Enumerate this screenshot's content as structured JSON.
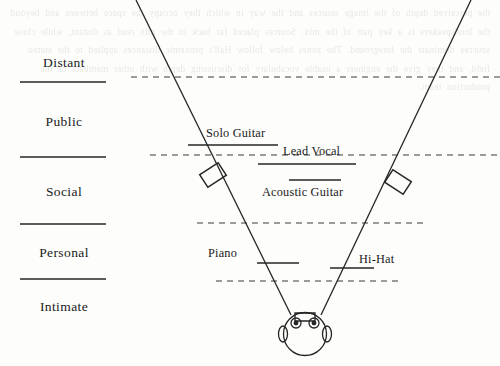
{
  "diagram": {
    "background_bleed_text": "the perceived depth of the image sources and the way in which they occupy the space between and beyond the loudspeakers is a key part of the mix. Sources placed far back in the mix read as distant, while close sources dominate the foreground. The zones below follow Hall's proxemic distances applied to the stereo field, and they give the engineer a usable vocabulary for discussing depth with other members of the production team.",
    "line_color": "#262626",
    "dash_color": "#3a3a3a",
    "zones": [
      {
        "id": "distant",
        "label": "Distant",
        "label_y": 55,
        "rule_y": 82,
        "rule_x1": 20,
        "rule_x2": 106
      },
      {
        "id": "public",
        "label": "Public",
        "label_y": 114,
        "rule_y": 157,
        "rule_x1": 20,
        "rule_x2": 106
      },
      {
        "id": "social",
        "label": "Social",
        "label_y": 184,
        "rule_y": 224,
        "rule_x1": 20,
        "rule_x2": 106
      },
      {
        "id": "personal",
        "label": "Personal",
        "label_y": 245,
        "rule_y": 279,
        "rule_x1": 20,
        "rule_x2": 106
      },
      {
        "id": "intimate",
        "label": "Intimate",
        "label_y": 299,
        "rule_y": null,
        "rule_x1": null,
        "rule_x2": null
      }
    ],
    "depth_dividers": [
      {
        "id": "divider-distant-public",
        "y": 77,
        "x1": 131,
        "x2": 500
      },
      {
        "id": "divider-public-social",
        "y": 155,
        "x1": 150,
        "x2": 500
      },
      {
        "id": "divider-social-personal",
        "y": 223,
        "x1": 197,
        "x2": 424
      },
      {
        "id": "divider-personal-intimate",
        "y": 281,
        "x1": 216,
        "x2": 399
      }
    ],
    "stage_edges": [
      {
        "id": "left-stage-edge",
        "x1": 136,
        "y1": 0,
        "x2": 290,
        "y2": 314
      },
      {
        "id": "right-stage-edge",
        "x1": 471,
        "y1": 0,
        "x2": 322,
        "y2": 314
      }
    ],
    "speakers": [
      {
        "id": "left-speaker",
        "x": 213,
        "y": 175,
        "angle": -28
      },
      {
        "id": "right-speaker",
        "x": 398,
        "y": 182,
        "angle": 28
      }
    ],
    "listener": {
      "id": "listener-head",
      "x": 305,
      "y": 334
    },
    "sources": [
      {
        "id": "solo-guitar",
        "label": "Solo Guitar",
        "text_x": 206,
        "text_y": 126,
        "align": "left",
        "rule_y": 145,
        "rule_x1": 188,
        "rule_x2": 278
      },
      {
        "id": "lead-vocal",
        "label": "Lead Vocal",
        "text_x": 283,
        "text_y": 144,
        "align": "left",
        "rule_y": 164,
        "rule_x1": 258,
        "rule_x2": 356
      },
      {
        "id": "acoustic-guitar",
        "label": "Acoustic Guitar",
        "text_x": 262,
        "text_y": 185,
        "align": "left",
        "rule_y": 180,
        "rule_x1": 289,
        "rule_x2": 341
      },
      {
        "id": "piano",
        "label": "Piano",
        "text_x": 208,
        "text_y": 246,
        "align": "left",
        "rule_y": 263,
        "rule_x1": 257,
        "rule_x2": 299
      },
      {
        "id": "hi-hat",
        "label": "Hi-Hat",
        "text_x": 359,
        "text_y": 252,
        "align": "left",
        "rule_y": 268,
        "rule_x1": 330,
        "rule_x2": 374
      }
    ]
  }
}
